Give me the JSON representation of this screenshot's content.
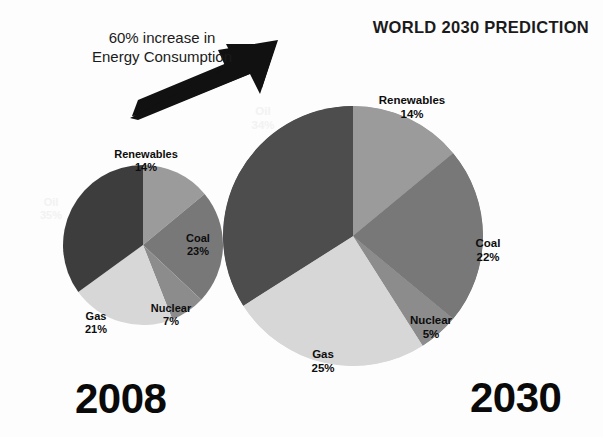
{
  "header": {
    "title": "WORLD 2030 PREDICTION"
  },
  "annotation": {
    "line1": "60% increase in",
    "line2": "Energy Consumption",
    "arrow_icon": "arrow-up-right-icon"
  },
  "years": {
    "left": "2008",
    "right": "2030"
  },
  "colors": {
    "oil_2008": "#3d3d3d",
    "oil_2030": "#4d4d4d",
    "renewables": "#9b9b9b",
    "coal": "#787878",
    "nuclear": "#8c8c8c",
    "gas": "#d7d7d7",
    "background": "#fdfdfd",
    "text": "#111111"
  },
  "chart_data": [
    {
      "type": "pie",
      "title": "2008",
      "categories": [
        "Renewables",
        "Coal",
        "Nuclear",
        "Gas",
        "Oil"
      ],
      "values": [
        14,
        23,
        7,
        21,
        35
      ],
      "labels": [
        "14%",
        "23%",
        "7%",
        "21%",
        "35%"
      ],
      "unit": "%",
      "legend": "none",
      "start_angle_deg": 0,
      "direction": "clockwise",
      "center_px": [
        143,
        245
      ],
      "radius_px": 80
    },
    {
      "type": "pie",
      "title": "2030",
      "categories": [
        "Renewables",
        "Coal",
        "Nuclear",
        "Gas",
        "Oil"
      ],
      "values": [
        14,
        22,
        5,
        25,
        34
      ],
      "labels": [
        "14%",
        "22%",
        "5%",
        "25%",
        "34%"
      ],
      "unit": "%",
      "legend": "none",
      "start_angle_deg": 0,
      "direction": "clockwise",
      "center_px": [
        353,
        236
      ],
      "radius_px": 130
    }
  ],
  "pie_2008": {
    "slices": [
      {
        "name": "Renewables",
        "pct": "14%"
      },
      {
        "name": "Coal",
        "pct": "23%"
      },
      {
        "name": "Nuclear",
        "pct": "7%"
      },
      {
        "name": "Gas",
        "pct": "21%"
      },
      {
        "name": "Oil",
        "pct": "35%"
      }
    ]
  },
  "pie_2030": {
    "slices": [
      {
        "name": "Renewables",
        "pct": "14%"
      },
      {
        "name": "Coal",
        "pct": "22%"
      },
      {
        "name": "Nuclear",
        "pct": "5%"
      },
      {
        "name": "Gas",
        "pct": "25%"
      },
      {
        "name": "Oil",
        "pct": "34%"
      }
    ]
  }
}
